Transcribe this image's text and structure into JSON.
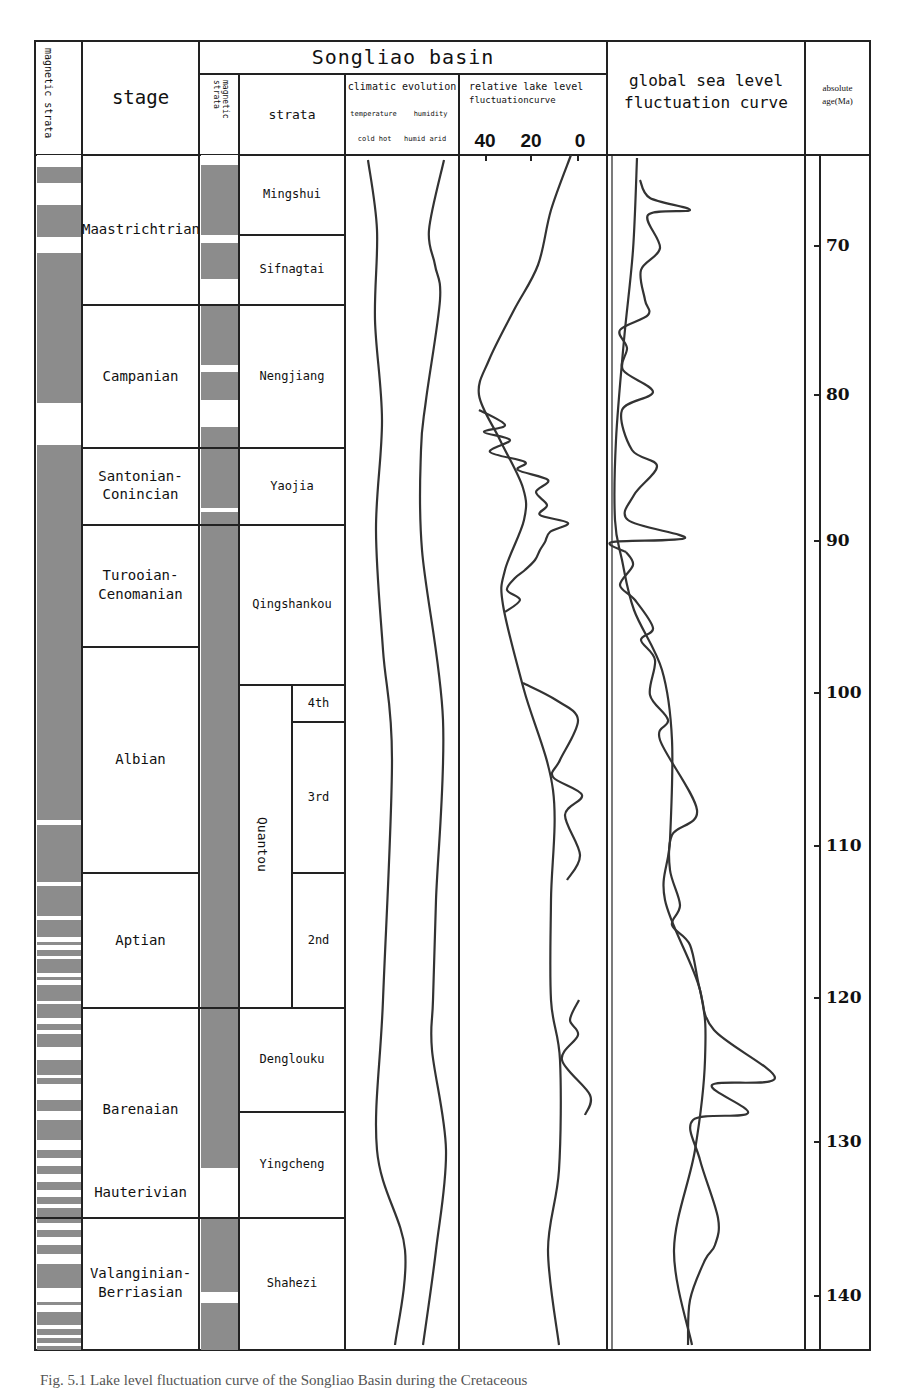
{
  "header": {
    "magnetic_strata_label": "magnetic strata",
    "stage_label": "stage",
    "basin_title": "Songliao basin",
    "basin_magnetic_strata_label": "magnetic strata",
    "strata_label": "strata",
    "climatic_title": "climatic evolution",
    "climatic_sub1_left": "temperature",
    "climatic_sub1_right": "humidity",
    "climatic_sub2": "cold hot   humid arid",
    "lake_title_1": "relative lake level",
    "lake_title_2": "fluctuationcurve",
    "lake_ticks": [
      "40",
      "20",
      "0"
    ],
    "global_title_1": "global sea level",
    "global_title_2": "fluctuation curve",
    "age_title_1": "absolute",
    "age_title_2": "age(Ma)"
  },
  "stages": [
    {
      "name": "Maastrichtrian",
      "top": 155,
      "bottom": 305
    },
    {
      "name": "Campanian",
      "top": 305,
      "bottom": 448
    },
    {
      "name": "Santonian-\nConincian",
      "top": 448,
      "bottom": 525
    },
    {
      "name": "Turooian-\nCenomanian",
      "top": 525,
      "bottom": 647
    },
    {
      "name": "Albian",
      "top": 647,
      "bottom": 873
    },
    {
      "name": "Aptian",
      "top": 873,
      "bottom": 1008
    },
    {
      "name": "Barenaian",
      "top": 1008,
      "bottom": 1218,
      "label_y": 1110
    },
    {
      "name": "Hauterivian",
      "top": 1008,
      "bottom": 1218,
      "label_y": 1193,
      "no_box": true
    },
    {
      "name": "Valanginian-\nBerriasian",
      "top": 1218,
      "bottom": 1350
    }
  ],
  "strata": [
    {
      "name": "Mingshui",
      "top": 155,
      "bottom": 235
    },
    {
      "name": "Sifnagtai",
      "top": 235,
      "bottom": 305
    },
    {
      "name": "Nengjiang",
      "top": 305,
      "bottom": 448
    },
    {
      "name": "Yaojia",
      "top": 448,
      "bottom": 525
    },
    {
      "name": "Qingshankou",
      "top": 525,
      "bottom": 685
    },
    {
      "name": "Denglouku",
      "top": 1008,
      "bottom": 1112
    },
    {
      "name": "Yingcheng",
      "top": 1112,
      "bottom": 1218
    },
    {
      "name": "Shahezi",
      "top": 1218,
      "bottom": 1350
    }
  ],
  "quantou": {
    "name": "Quantou",
    "top": 685,
    "bottom": 1008,
    "members": [
      {
        "name": "4th",
        "top": 685,
        "bottom": 722
      },
      {
        "name": "3rd",
        "top": 722,
        "bottom": 873
      },
      {
        "name": "2nd",
        "top": 873,
        "bottom": 1008
      }
    ]
  },
  "age_axis": {
    "ticks": [
      {
        "label": "70",
        "y": 246
      },
      {
        "label": "80",
        "y": 395
      },
      {
        "label": "90",
        "y": 541
      },
      {
        "label": "100",
        "y": 693
      },
      {
        "label": "110",
        "y": 846
      },
      {
        "label": "120",
        "y": 998
      },
      {
        "label": "130",
        "y": 1142
      },
      {
        "label": "140",
        "y": 1296
      }
    ]
  },
  "magnetic_column_1_white_bands": [
    [
      155,
      167
    ],
    [
      183,
      205
    ],
    [
      237,
      253
    ],
    [
      403,
      445
    ],
    [
      820,
      825
    ],
    [
      882,
      886
    ],
    [
      916,
      920
    ],
    [
      937,
      942
    ],
    [
      945,
      950
    ],
    [
      956,
      959
    ],
    [
      973,
      977
    ],
    [
      980,
      985
    ],
    [
      1001,
      1004
    ],
    [
      1018,
      1024
    ],
    [
      1030,
      1034
    ],
    [
      1047,
      1060
    ],
    [
      1075,
      1078
    ],
    [
      1084,
      1100
    ],
    [
      1111,
      1120
    ],
    [
      1140,
      1150
    ],
    [
      1158,
      1166
    ],
    [
      1174,
      1182
    ],
    [
      1190,
      1197
    ],
    [
      1204,
      1208
    ],
    [
      1223,
      1230
    ],
    [
      1237,
      1245
    ],
    [
      1254,
      1264
    ],
    [
      1288,
      1302
    ],
    [
      1305,
      1312
    ],
    [
      1325,
      1329
    ],
    [
      1335,
      1338
    ],
    [
      1343,
      1346
    ]
  ],
  "magnetic_column_2_white_bands": [
    [
      155,
      165
    ],
    [
      235,
      243
    ],
    [
      279,
      305
    ],
    [
      365,
      372
    ],
    [
      400,
      427
    ],
    [
      508,
      512
    ],
    [
      1168,
      1218
    ],
    [
      1292,
      1303
    ]
  ],
  "chart_data": {
    "type": "line",
    "ylabel": "absolute age (Ma)",
    "ylim": [
      65,
      145
    ],
    "lake_xlabel": "relative lake level fluctuation curve",
    "lake_xticks": [
      40,
      20,
      0
    ],
    "series": [
      {
        "name": "temperature",
        "points": [
          [
            368,
            160
          ],
          [
            377,
            230
          ],
          [
            375,
            320
          ],
          [
            382,
            420
          ],
          [
            376,
            530
          ],
          [
            383,
            650
          ],
          [
            392,
            760
          ],
          [
            383,
            1000
          ],
          [
            377,
            1150
          ],
          [
            405,
            1250
          ],
          [
            395,
            1345
          ]
        ]
      },
      {
        "name": "humidity",
        "points": [
          [
            444,
            160
          ],
          [
            429,
            230
          ],
          [
            435,
            265
          ],
          [
            440,
            300
          ],
          [
            426,
            400
          ],
          [
            421,
            450
          ],
          [
            422,
            550
          ],
          [
            443,
            720
          ],
          [
            436,
            900
          ],
          [
            433,
            1000
          ],
          [
            432,
            1050
          ],
          [
            446,
            1150
          ],
          [
            436,
            1250
          ],
          [
            423,
            1345
          ]
        ]
      },
      {
        "name": "lake_level_smooth",
        "points": [
          [
            571,
            155
          ],
          [
            551,
            210
          ],
          [
            538,
            265
          ],
          [
            514,
            310
          ],
          [
            489,
            360
          ],
          [
            479,
            395
          ],
          [
            500,
            440
          ],
          [
            523,
            488
          ],
          [
            524,
            520
          ],
          [
            505,
            570
          ],
          [
            503,
            605
          ],
          [
            524,
            690
          ],
          [
            553,
            790
          ],
          [
            551,
            900
          ],
          [
            551,
            1000
          ],
          [
            560,
            1060
          ],
          [
            559,
            1170
          ],
          [
            548,
            1250
          ],
          [
            559,
            1345
          ]
        ]
      },
      {
        "name": "lake_level_oscillations",
        "points": [
          [
            479,
            410
          ],
          [
            505,
            425
          ],
          [
            484,
            432
          ],
          [
            510,
            440
          ],
          [
            490,
            452
          ],
          [
            525,
            462
          ],
          [
            518,
            470
          ],
          [
            548,
            480
          ],
          [
            536,
            492
          ],
          [
            547,
            505
          ],
          [
            540,
            515
          ],
          [
            568,
            523
          ],
          [
            550,
            532
          ],
          [
            545,
            542
          ],
          [
            540,
            550
          ],
          [
            535,
            560
          ],
          [
            525,
            570
          ],
          [
            515,
            578
          ],
          [
            507,
            590
          ],
          [
            520,
            600
          ],
          [
            505,
            612
          ]
        ]
      },
      {
        "name": "global_sea_level_smooth",
        "points": [
          [
            637,
            158
          ],
          [
            633,
            250
          ],
          [
            624,
            340
          ],
          [
            616,
            440
          ],
          [
            615,
            520
          ],
          [
            622,
            560
          ],
          [
            634,
            610
          ],
          [
            662,
            670
          ],
          [
            672,
            740
          ],
          [
            670,
            840
          ],
          [
            665,
            900
          ],
          [
            700,
            990
          ],
          [
            705,
            1060
          ],
          [
            695,
            1150
          ],
          [
            674,
            1250
          ],
          [
            692,
            1345
          ]
        ]
      },
      {
        "name": "global_sea_level_detail",
        "points": [
          [
            640,
            180
          ],
          [
            650,
            198
          ],
          [
            690,
            210
          ],
          [
            648,
            215
          ],
          [
            660,
            248
          ],
          [
            641,
            270
          ],
          [
            645,
            300
          ],
          [
            648,
            315
          ],
          [
            620,
            330
          ],
          [
            627,
            348
          ],
          [
            623,
            370
          ],
          [
            653,
            392
          ],
          [
            622,
            410
          ],
          [
            632,
            450
          ],
          [
            657,
            466
          ],
          [
            634,
            495
          ],
          [
            628,
            520
          ],
          [
            685,
            538
          ],
          [
            612,
            542
          ],
          [
            626,
            552
          ]
        ]
      }
    ]
  },
  "caption": "Fig. 5.1  Lake level fluctuation curve of the Songliao Basin during the Cretaceous"
}
